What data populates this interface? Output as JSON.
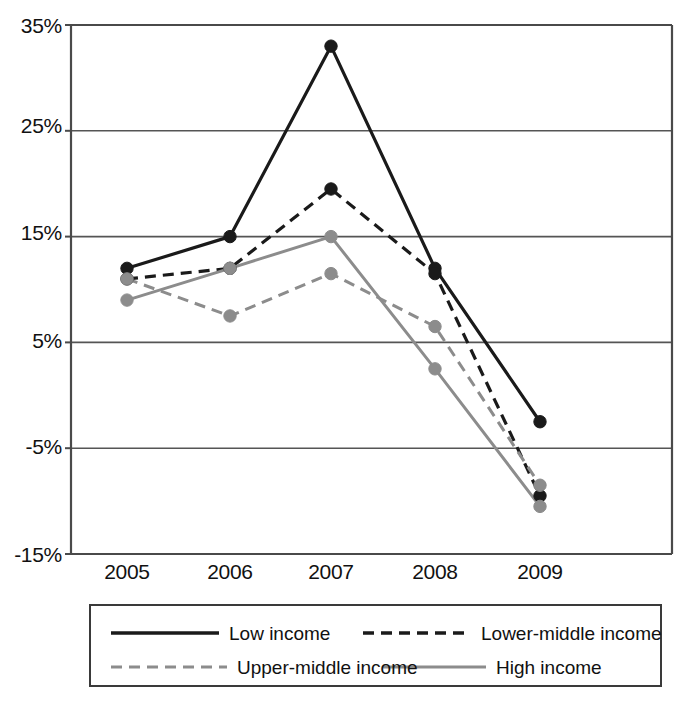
{
  "chart_data": {
    "type": "line",
    "title": "",
    "subtitle": "",
    "xlabel": "",
    "ylabel": "",
    "categories": [
      "2005",
      "2006",
      "2007",
      "2008",
      "2009"
    ],
    "x": [
      2005,
      2006,
      2007,
      2008,
      2009
    ],
    "ylim": [
      -15,
      35
    ],
    "yticks": [
      35,
      25,
      15,
      5,
      -5,
      -15
    ],
    "ytick_labels": [
      "35%",
      "25%",
      "15%",
      "5%",
      "-5%",
      "-15%"
    ],
    "grid": "horizontal",
    "legend_position": "bottom",
    "series": [
      {
        "name": "Low income",
        "color": "#1a1a1a",
        "style": "solid",
        "marker": "circle",
        "values": [
          12,
          15,
          33,
          12,
          -2.5
        ]
      },
      {
        "name": "Lower-middle income",
        "color": "#1a1a1a",
        "style": "dashed",
        "marker": "circle",
        "values": [
          11,
          12,
          19.5,
          11.5,
          -9.5
        ]
      },
      {
        "name": "Upper-middle income",
        "color": "#8c8c8c",
        "style": "dashed",
        "marker": "circle",
        "values": [
          11,
          7.5,
          11.5,
          6.5,
          -8.5
        ]
      },
      {
        "name": "High income",
        "color": "#8c8c8c",
        "style": "solid",
        "marker": "circle",
        "values": [
          9,
          12,
          15,
          2.5,
          -10.5
        ]
      }
    ]
  },
  "axis": {
    "ytick_0": "35%",
    "ytick_1": "25%",
    "ytick_2": "15%",
    "ytick_3": "5%",
    "ytick_4": "-5%",
    "ytick_5": "-15%",
    "xtick_0": "2005",
    "xtick_1": "2006",
    "xtick_2": "2007",
    "xtick_3": "2008",
    "xtick_4": "2009"
  },
  "legend": {
    "entries": [
      {
        "label": "Low income",
        "color": "#1a1a1a",
        "style": "solid"
      },
      {
        "label": "Lower-middle income",
        "color": "#1a1a1a",
        "style": "dashed"
      },
      {
        "label": "Upper-middle income",
        "color": "#8c8c8c",
        "style": "dashed"
      },
      {
        "label": "High income",
        "color": "#8c8c8c",
        "style": "solid"
      }
    ]
  },
  "colors": {
    "axis": "#4a4a4a",
    "grid": "#555555",
    "dark_series": "#1a1a1a",
    "light_series": "#8c8c8c",
    "background": "#ffffff",
    "text": "#111111"
  }
}
